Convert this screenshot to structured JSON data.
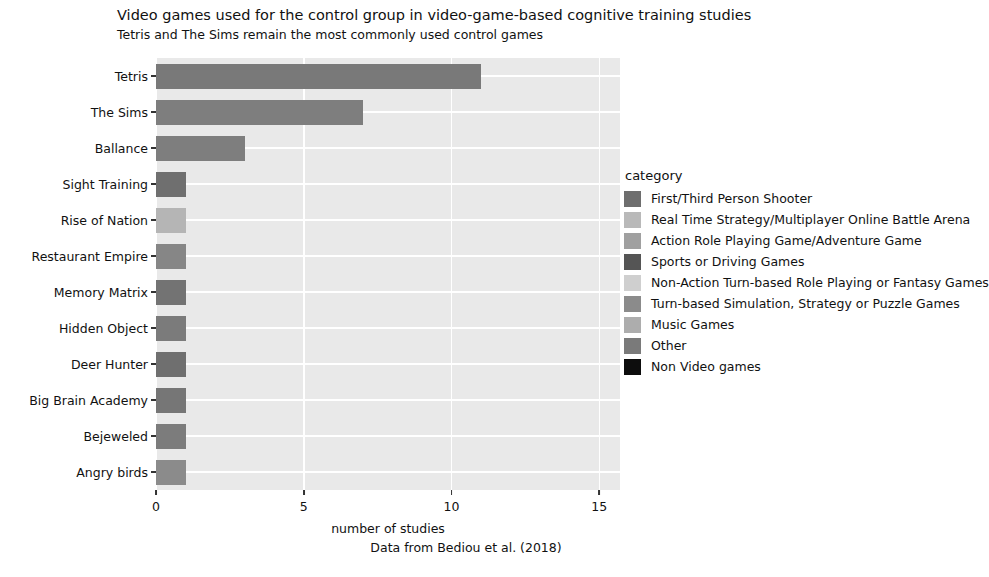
{
  "chart_data": {
    "type": "bar",
    "orientation": "horizontal",
    "title": "Video games used for the control group in video-game-based cognitive training studies",
    "subtitle": "Tetris and The Sims remain the most commonly used control games",
    "caption": "Data from Bediou et al. (2018)",
    "xlabel": "number of studies",
    "ylabel": "",
    "xlim": [
      0,
      15.7
    ],
    "xticks": [
      0,
      5,
      10,
      15
    ],
    "xticklabels": [
      "0",
      "5",
      "10",
      "15"
    ],
    "grid": true,
    "legend_position": "right",
    "categories": [
      "Tetris",
      "The Sims",
      "Ballance",
      "Sight Training",
      "Rise of Nation",
      "Restaurant Empire",
      "Memory Matrix",
      "Hidden Object",
      "Deer Hunter",
      "Big Brain Academy",
      "Bejeweled",
      "Angry birds"
    ],
    "values": [
      11,
      7,
      3,
      1,
      1,
      1,
      1,
      1,
      1,
      1,
      1,
      1
    ],
    "bar_colors": [
      "#797979",
      "#7e7e7e",
      "#7e7e7e",
      "#6f6f6f",
      "#b5b5b5",
      "#868686",
      "#737373",
      "#7b7b7b",
      "#6f6f6f",
      "#767676",
      "#7c7c7c",
      "#8b8b8b"
    ]
  },
  "legend": {
    "title": "category",
    "items": [
      {
        "label": "First/Third Person Shooter",
        "color": "#6e6e6e"
      },
      {
        "label": "Real Time Strategy/Multiplayer Online Battle Arena",
        "color": "#b9b9b9"
      },
      {
        "label": "Action Role Playing Game/Adventure Game",
        "color": "#a0a0a0"
      },
      {
        "label": "Sports or Driving Games",
        "color": "#555555"
      },
      {
        "label": "Non-Action Turn-based Role Playing or Fantasy Games",
        "color": "#cfcfcf"
      },
      {
        "label": "Turn-based Simulation, Strategy or Puzzle Games",
        "color": "#8b8b8b"
      },
      {
        "label": "Music Games",
        "color": "#adadad"
      },
      {
        "label": "Other",
        "color": "#7a7a7a"
      },
      {
        "label": "Non Video games",
        "color": "#0d0d0d"
      }
    ]
  },
  "style": {
    "plot_background": "#e9e9e9",
    "gridline_color": "#ffffff",
    "page_background": "#ffffff",
    "text_color": "#111111"
  }
}
